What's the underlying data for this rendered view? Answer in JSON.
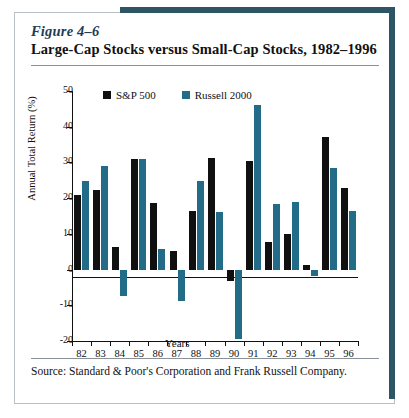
{
  "figure": {
    "number": "Figure 4–6",
    "title": "Large-Cap Stocks versus Small-Cap Stocks, 1982–1996",
    "source": "Source:  Standard & Poor's Corporation and Frank Russell Company.",
    "accent_color": "#2d5566"
  },
  "chart_data": {
    "type": "bar",
    "title": "Large-Cap Stocks versus Small-Cap Stocks, 1982–1996",
    "xlabel": "Years",
    "ylabel": "Annual Total Return (%)",
    "categories": [
      "82",
      "83",
      "84",
      "85",
      "86",
      "87",
      "88",
      "89",
      "90",
      "91",
      "92",
      "93",
      "94",
      "95",
      "96"
    ],
    "yticks": [
      50,
      40,
      30,
      20,
      10,
      0,
      -10,
      -20
    ],
    "ylim": [
      -20,
      50
    ],
    "grid": false,
    "legend_position": "top-center",
    "series": [
      {
        "name": "S&P 500",
        "color": "#101010",
        "values": [
          21.0,
          22.3,
          6.3,
          31.1,
          18.6,
          5.2,
          16.5,
          31.2,
          -3.2,
          30.5,
          7.7,
          10.0,
          1.3,
          37.0,
          22.8
        ]
      },
      {
        "name": "Russell 2000",
        "color": "#236C87",
        "values": [
          24.9,
          29.1,
          -7.3,
          31.0,
          5.7,
          -8.8,
          24.9,
          16.2,
          -19.5,
          46.0,
          18.4,
          18.9,
          -1.8,
          28.4,
          16.5
        ]
      }
    ]
  }
}
